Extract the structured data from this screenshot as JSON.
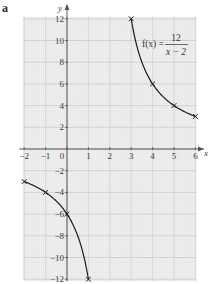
{
  "figure": {
    "label": "a"
  },
  "chart_data": {
    "type": "line",
    "title": "",
    "xlabel": "x",
    "ylabel": "y",
    "xlim": [
      -2,
      6
    ],
    "ylim": [
      -12,
      12
    ],
    "grid": true,
    "x_ticks": [
      "-2",
      "-1",
      "0",
      "1",
      "2",
      "3",
      "4",
      "5",
      "6"
    ],
    "y_ticks": [
      "12",
      "10",
      "8",
      "6",
      "4",
      "2",
      "-2",
      "-4",
      "-6",
      "-8",
      "-10",
      "-12"
    ],
    "annotation": {
      "text_lhs": "f(x) =",
      "numerator": "12",
      "denominator": "x − 2"
    },
    "function": "f(x) = 12/(x-2)",
    "series": [
      {
        "name": "right branch",
        "x": [
          3,
          4,
          5,
          6
        ],
        "y": [
          12,
          6,
          4,
          3
        ]
      },
      {
        "name": "left branch",
        "x": [
          -2,
          -1,
          0,
          1
        ],
        "y": [
          -3,
          -4,
          -6,
          -12
        ]
      }
    ],
    "marker": "x",
    "colors": {
      "grid_minor": "#e4e4e4",
      "grid_major": "#c8c8c8",
      "background": "#f1f1f1",
      "curve": "#1a1a1a",
      "axis": "#555555"
    }
  }
}
